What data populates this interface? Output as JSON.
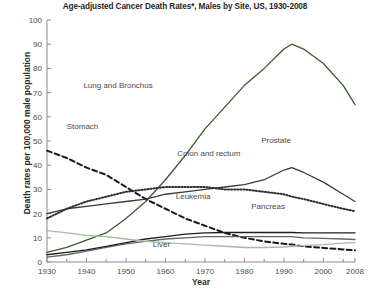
{
  "chart_data": {
    "type": "line",
    "title": "Age-adjusted Cancer Death Rates*, Males by Site, US, 1930-2008",
    "xlabel": "Year",
    "ylabel": "Death rates per 100,000 male population",
    "xlim": [
      1930,
      2008
    ],
    "ylim": [
      0,
      100
    ],
    "xticks": [
      1930,
      1940,
      1950,
      1960,
      1970,
      1980,
      1990,
      2000,
      2008
    ],
    "xtick_labels": [
      "1930",
      "1940",
      "1950",
      "1960",
      "1970",
      "1980",
      "1990",
      "2000",
      "2008"
    ],
    "yticks": [
      0,
      10,
      20,
      30,
      40,
      50,
      60,
      70,
      80,
      90,
      100
    ],
    "ytick_labels": [
      "0",
      "10",
      "20",
      "30",
      "40",
      "50",
      "60",
      "70",
      "80",
      "90",
      "100"
    ],
    "grid": false,
    "legend": "inline-labels",
    "x": [
      1930,
      1935,
      1940,
      1945,
      1950,
      1955,
      1960,
      1965,
      1970,
      1975,
      1980,
      1985,
      1990,
      1992,
      1995,
      2000,
      2005,
      2008
    ],
    "series": [
      {
        "name": "Lung and Bronchus",
        "color": "#3d5a2a",
        "style": "solid",
        "label_x": 1948,
        "label_y": 72,
        "values": [
          4,
          6,
          9,
          12,
          18,
          25,
          34,
          44,
          55,
          64,
          73,
          80,
          88,
          90,
          88,
          82,
          73,
          65
        ]
      },
      {
        "name": "Stomach",
        "color": "#1a1a1a",
        "style": "dashed",
        "label_x": 1939,
        "label_y": 55,
        "values": [
          46,
          43,
          39,
          36,
          31,
          26,
          22,
          18,
          15,
          12,
          10,
          8.5,
          7.5,
          7.2,
          6.5,
          5.8,
          5.2,
          4.8
        ]
      },
      {
        "name": "Prostate",
        "color": "#3a3a3a",
        "style": "solid",
        "label_x": 1988,
        "label_y": 49,
        "values": [
          20,
          22,
          23,
          24,
          25,
          26,
          28,
          29,
          30,
          31,
          32,
          34,
          38,
          39,
          37,
          33,
          28,
          25
        ]
      },
      {
        "name": "Colon and rectum",
        "color": "#2f2f2f",
        "style": "dotted",
        "label_x": 1971,
        "label_y": 44,
        "values": [
          18,
          22,
          25,
          27,
          29,
          30,
          31,
          31,
          31,
          30,
          30,
          29,
          28,
          27,
          26,
          24,
          22,
          21
        ]
      },
      {
        "name": "Leukemia",
        "color": "#5a6b5a",
        "style": "solid",
        "label_x": 1967,
        "label_y": 26,
        "values": [
          2,
          3,
          4.5,
          6,
          7.5,
          8.5,
          9.5,
          10,
          10.5,
          10.5,
          10.5,
          10.5,
          10.5,
          10.5,
          10,
          9.8,
          9.5,
          9.3
        ]
      },
      {
        "name": "Pancreas",
        "color": "#1f1f1f",
        "style": "solid",
        "label_x": 1986,
        "label_y": 22,
        "values": [
          3,
          4,
          5,
          6.5,
          8,
          9.5,
          10.5,
          11.5,
          12,
          12.2,
          12.2,
          12.2,
          12.2,
          12.2,
          12,
          12,
          12,
          12
        ]
      },
      {
        "name": "Liver",
        "color": "#9fbd9f",
        "style": "solid",
        "label_x": 1959,
        "label_y": 6,
        "values": [
          13,
          12,
          11,
          10.5,
          9.5,
          8.5,
          8,
          7.5,
          7,
          6.5,
          6,
          6,
          6.2,
          6.5,
          6.8,
          7.2,
          7.8,
          8
        ]
      }
    ],
    "footnote": "*"
  }
}
